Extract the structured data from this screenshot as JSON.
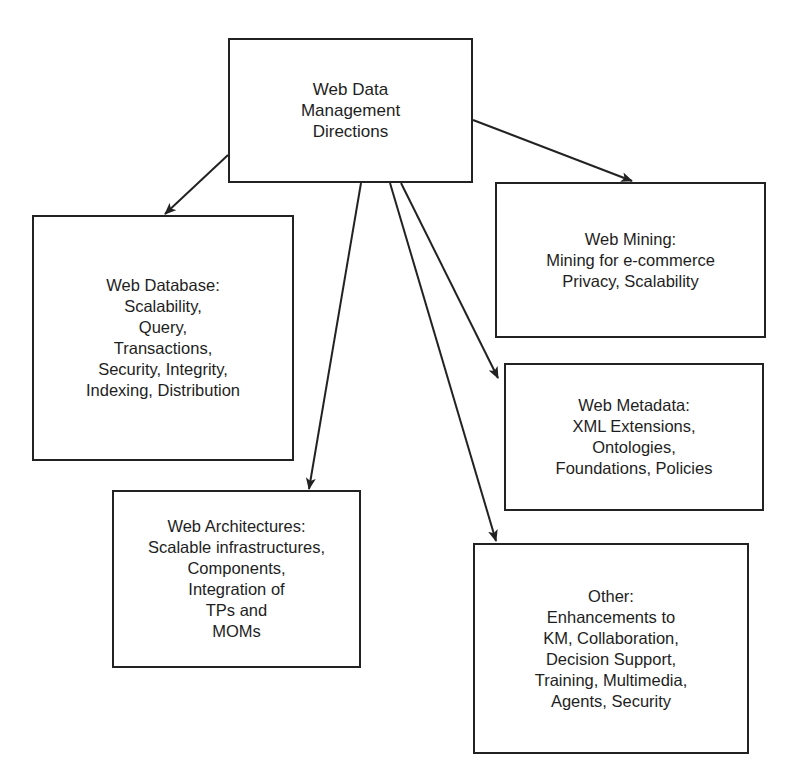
{
  "diagram": {
    "root": {
      "id": "root",
      "lines": [
        "Web Data",
        "Management",
        "Directions"
      ],
      "box": {
        "x": 228,
        "y": 38,
        "w": 245,
        "h": 145
      }
    },
    "children": [
      {
        "id": "web-database",
        "lines": [
          "Web Database:",
          "Scalability,",
          "Query,",
          "Transactions,",
          "Security, Integrity,",
          "Indexing, Distribution"
        ],
        "box": {
          "x": 32,
          "y": 215,
          "w": 262,
          "h": 246
        }
      },
      {
        "id": "web-mining",
        "lines": [
          "Web Mining:",
          "Mining for e-commerce",
          "Privacy, Scalability"
        ],
        "box": {
          "x": 495,
          "y": 182,
          "w": 271,
          "h": 156
        }
      },
      {
        "id": "web-metadata",
        "lines": [
          "Web Metadata:",
          "XML Extensions,",
          "Ontologies,",
          "Foundations, Policies"
        ],
        "box": {
          "x": 504,
          "y": 363,
          "w": 260,
          "h": 148
        }
      },
      {
        "id": "web-architectures",
        "lines": [
          "Web Architectures:",
          "Scalable infrastructures,",
          "Components,",
          "Integration of",
          "TPs and",
          "MOMs"
        ],
        "box": {
          "x": 112,
          "y": 490,
          "w": 249,
          "h": 178
        }
      },
      {
        "id": "other",
        "lines": [
          "Other:",
          "Enhancements to",
          "KM, Collaboration,",
          "Decision Support,",
          "Training, Multimedia,",
          "Agents, Security"
        ],
        "box": {
          "x": 473,
          "y": 543,
          "w": 276,
          "h": 211
        }
      }
    ],
    "edges": [
      {
        "from": "root",
        "to": "web-database",
        "x1": 228,
        "y1": 155,
        "x2": 165,
        "y2": 214
      },
      {
        "from": "root",
        "to": "web-mining",
        "x1": 473,
        "y1": 120,
        "x2": 632,
        "y2": 181
      },
      {
        "from": "root",
        "to": "web-architectures",
        "x1": 361,
        "y1": 183,
        "x2": 309,
        "y2": 489
      },
      {
        "from": "root",
        "to": "other",
        "x1": 390,
        "y1": 183,
        "x2": 496,
        "y2": 541
      },
      {
        "from": "root",
        "to": "web-metadata",
        "x1": 401,
        "y1": 183,
        "x2": 498,
        "y2": 378
      }
    ],
    "colors": {
      "stroke": "#222222",
      "text": "#1e1e1e",
      "background": "#ffffff"
    }
  }
}
